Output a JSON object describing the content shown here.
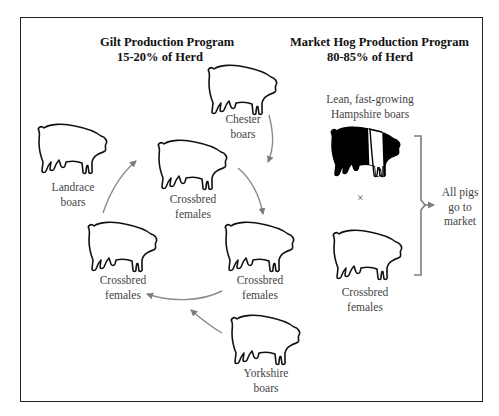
{
  "diagram": {
    "type": "rotational-crossbreeding-flow",
    "colors": {
      "frame": "#222222",
      "pig_outline": "#111111",
      "pig_fill_hampshire": "#000000",
      "arrow": "#808080",
      "text": "#444444"
    }
  },
  "gilt_program": {
    "title": "Gilt Production Program",
    "subtitle": "15-20% of Herd",
    "nodes": [
      {
        "id": "chester",
        "label_line1": "Chester",
        "label_line2": "boars"
      },
      {
        "id": "landrace",
        "label_line1": "Landrace",
        "label_line2": "boars"
      },
      {
        "id": "crossbred_top",
        "label_line1": "Crossbred",
        "label_line2": "females"
      },
      {
        "id": "crossbred_left",
        "label_line1": "Crossbred",
        "label_line2": "females"
      },
      {
        "id": "crossbred_right",
        "label_line1": "Crossbred",
        "label_line2": "females"
      },
      {
        "id": "yorkshire",
        "label_line1": "Yorkshire",
        "label_line2": "boars"
      }
    ],
    "arrows": [
      {
        "from": "chester",
        "to": "crossbred_right"
      },
      {
        "from": "crossbred_top",
        "to": "crossbred_right"
      },
      {
        "from": "crossbred_right",
        "to": "crossbred_left"
      },
      {
        "from": "yorkshire",
        "to": "crossbred_left"
      },
      {
        "from": "crossbred_left",
        "to": "crossbred_top"
      }
    ]
  },
  "market_program": {
    "title": "Market Hog Production Program",
    "subtitle": "80-85% of Herd",
    "boar_label_line1": "Lean, fast-growing",
    "boar_label_line2": "Hampshire boars",
    "cross_symbol": "×",
    "female_label_line1": "Crossbred",
    "female_label_line2": "females",
    "result_line1": "All pigs",
    "result_line2": "go to",
    "result_line3": "market"
  }
}
